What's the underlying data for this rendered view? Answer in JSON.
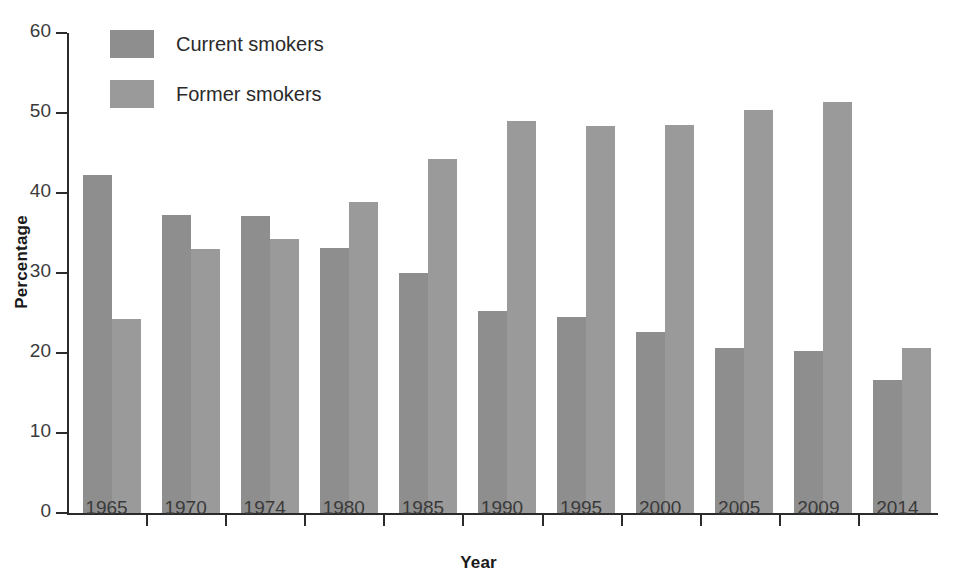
{
  "chart_data": {
    "type": "bar",
    "title": "",
    "xlabel": "Year",
    "ylabel": "Percentage",
    "categories": [
      "1965",
      "1970",
      "1974",
      "1980",
      "1985",
      "1990",
      "1995",
      "2000",
      "2005",
      "2009",
      "2014"
    ],
    "series": [
      {
        "name": "Current smokers",
        "color": "#8e8e8e",
        "values": [
          42.3,
          37.3,
          37.1,
          33.1,
          30.0,
          25.3,
          24.5,
          22.6,
          20.6,
          20.2,
          16.6
        ]
      },
      {
        "name": "Former smokers",
        "color": "#9a9a9a",
        "values": [
          24.2,
          33.0,
          34.3,
          38.9,
          44.3,
          49.0,
          48.4,
          48.5,
          50.4,
          51.4,
          20.6
        ]
      }
    ],
    "ylim": [
      0,
      60
    ],
    "yticks": [
      "0",
      "10",
      "20",
      "30",
      "40",
      "50",
      "60"
    ],
    "ytick_values": [
      0,
      10,
      20,
      30,
      40,
      50,
      60
    ],
    "grid": false,
    "legend_position": "top-left"
  },
  "legend": {
    "items": [
      {
        "label": "Current smokers",
        "swatch": "current"
      },
      {
        "label": "Former smokers",
        "swatch": "former"
      }
    ]
  },
  "axes": {
    "y_title": "Percentage",
    "x_title": "Year"
  }
}
